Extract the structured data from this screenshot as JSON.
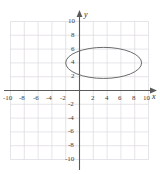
{
  "chart_data": {
    "type": "line",
    "title": "",
    "subtitle": "",
    "xlabel": "x",
    "ylabel": "y",
    "xlim": [
      -11.5,
      11.5
    ],
    "ylim": [
      -11.5,
      11.5
    ],
    "grid": true,
    "grid_step": 2,
    "legend": "none",
    "x_ticks": [
      -10,
      -8,
      -6,
      -4,
      -2,
      2,
      4,
      6,
      8,
      10
    ],
    "y_ticks": [
      10,
      8,
      6,
      4,
      2,
      -2,
      -4,
      -6,
      -8,
      -10
    ],
    "x_tick_labels": [
      "-10",
      "-8",
      "-6",
      "-4",
      "-2",
      "2",
      "4",
      "6",
      "8",
      "10"
    ],
    "y_tick_labels": [
      "10",
      "8",
      "6",
      "4",
      "2",
      "-2",
      "-4",
      "-6",
      "-8",
      "-10"
    ],
    "annotations": [],
    "series": [
      {
        "name": "ellipse",
        "shape": "ellipse",
        "center": [
          3.5,
          4.0
        ],
        "semi_axis_x": 5.5,
        "semi_axis_y": 2.25,
        "x_extent": [
          -2.0,
          9.0
        ],
        "y_extent": [
          1.75,
          6.25
        ],
        "color": "#6b6b6b",
        "line_width": 1.0,
        "fill": "none"
      }
    ]
  },
  "colors": {
    "axis": "#5a5a5a",
    "grid": "#ddd9e0",
    "curve": "#6b6b6b",
    "tick_text": "#3d3d3d",
    "background": "#ffffff"
  },
  "axis_labels": {
    "x": "x",
    "y": "y"
  }
}
